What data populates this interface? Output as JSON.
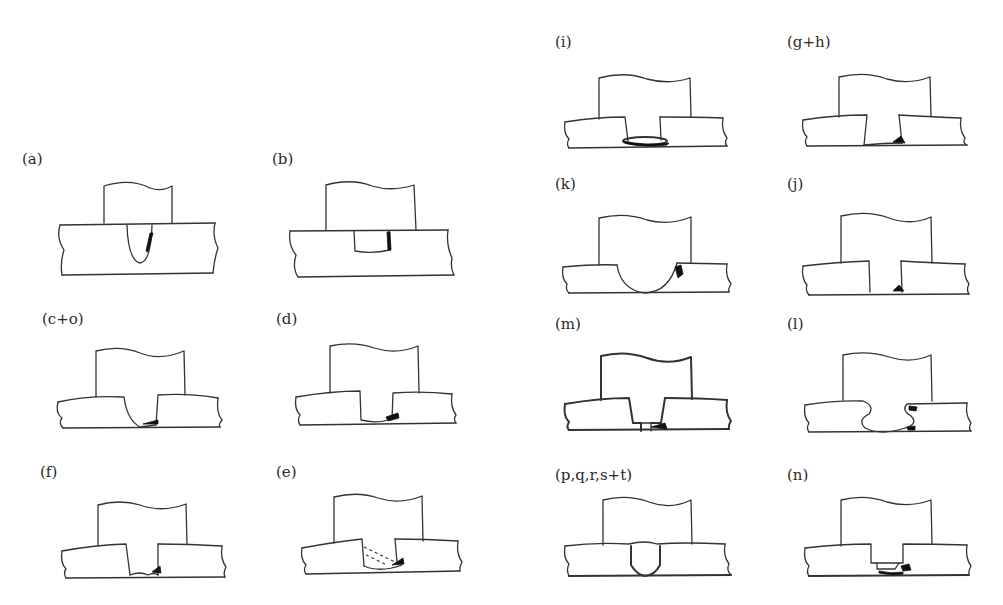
{
  "figure": {
    "panels": [
      {
        "id": "a",
        "label": "(a)",
        "variant": "u-notch"
      },
      {
        "id": "b",
        "label": "(b)",
        "variant": "shallow-flat"
      },
      {
        "id": "c_o",
        "label": "(c+o)",
        "variant": "deep-rounded"
      },
      {
        "id": "d",
        "label": "(d)",
        "variant": "deep-flat"
      },
      {
        "id": "f",
        "label": "(f)",
        "variant": "deep-flat-thin"
      },
      {
        "id": "e",
        "label": "(e)",
        "variant": "deep-dashed"
      },
      {
        "id": "i",
        "label": "(i)",
        "variant": "deep-lens"
      },
      {
        "id": "g_h",
        "label": "(g+h)",
        "variant": "deep-flat-thin"
      },
      {
        "id": "k",
        "label": "(k)",
        "variant": "round-bottom"
      },
      {
        "id": "j",
        "label": "(j)",
        "variant": "deep-flat-thin"
      },
      {
        "id": "m",
        "label": "(m)",
        "variant": "stepped"
      },
      {
        "id": "l",
        "label": "(l)",
        "variant": "bulged"
      },
      {
        "id": "p_q_r_s_t",
        "label": "(p,q,r,s+t)",
        "variant": "u-bold"
      },
      {
        "id": "n",
        "label": "(n)",
        "variant": "stepped-flat"
      }
    ]
  }
}
